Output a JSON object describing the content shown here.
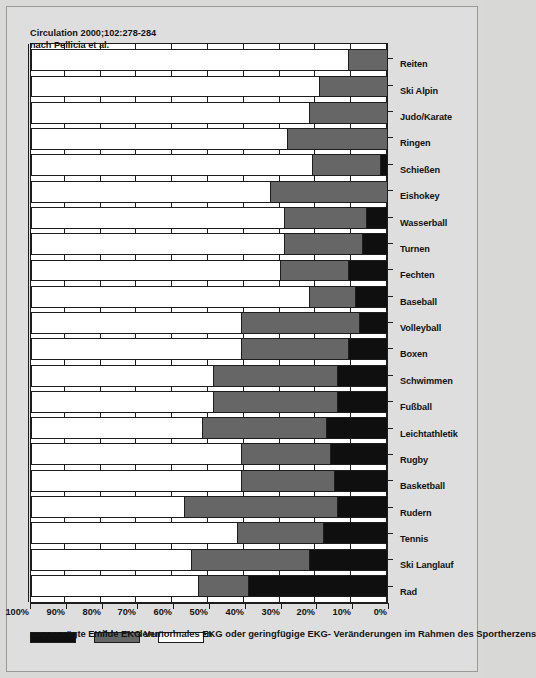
{
  "chart_data": {
    "type": "bar",
    "subtype": "stacked-horizontal-percent",
    "title": "",
    "xlabel": "",
    "ylabel": "",
    "ylim": [
      0,
      100
    ],
    "grid": true,
    "legend_position": "bottom-left",
    "axis_tick_labels": [
      "0%",
      "10%",
      "20%",
      "30%",
      "40%",
      "50%",
      "60%",
      "70%",
      "80%",
      "90%",
      "100%"
    ],
    "categories": [
      "Rad",
      "Ski Langlauf",
      "Tennis",
      "Rudern",
      "Basketball",
      "Rugby",
      "Leichtathletik",
      "Fußball",
      "Schwimmen",
      "Boxen",
      "Volleyball",
      "Baseball",
      "Fechten",
      "Turnen",
      "Wasserball",
      "Eishokey",
      "Schießen",
      "Ringen",
      "Judo/Karate",
      "Ski Alpin",
      "Reiten"
    ],
    "series": [
      {
        "name": "ausgeprägte EKG Veränderungen",
        "color": "#0f0f0f",
        "values": [
          39,
          22,
          18,
          14,
          15,
          16,
          17,
          14,
          14,
          11,
          8,
          9,
          11,
          7,
          6,
          0,
          2,
          0,
          0,
          0,
          0
        ]
      },
      {
        "name": "milde EKG Veränderungen",
        "color": "#666666",
        "values": [
          14,
          33,
          24,
          43,
          26,
          25,
          35,
          35,
          35,
          30,
          33,
          13,
          19,
          22,
          23,
          33,
          19,
          28,
          22,
          19,
          11
        ]
      },
      {
        "name": "normales EKG oder geringfügige EKG- Veränderungen im Rahmen des Sportherzens",
        "color": "#ffffff",
        "values": [
          47,
          45,
          58,
          43,
          59,
          59,
          48,
          51,
          51,
          59,
          59,
          78,
          70,
          71,
          71,
          67,
          79,
          72,
          78,
          81,
          89
        ]
      }
    ]
  },
  "legend": {
    "entries": [
      {
        "label": "ausgeprägte EKG Veränderungen",
        "swatch": "severe"
      },
      {
        "label": "milde EKG Veränderungen",
        "swatch": "mild"
      },
      {
        "label": "normales EKG oder geringfügige EKG- Veränderungen im Rahmen des Sportherzens",
        "swatch": "normal"
      }
    ]
  },
  "source": {
    "line1": "nach Pellicia et al.",
    "line2": "Circulation 2000;102:278-284"
  }
}
